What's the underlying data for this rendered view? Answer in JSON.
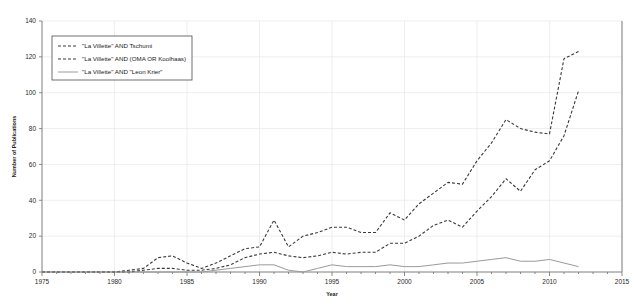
{
  "chart_data": {
    "type": "line",
    "title": "",
    "xlabel": "Year",
    "ylabel": "Number of Publications",
    "xlim": [
      1975,
      2015
    ],
    "ylim": [
      0,
      140
    ],
    "xticks": [
      1975,
      1980,
      1985,
      1990,
      1995,
      2000,
      2005,
      2010,
      2015
    ],
    "yticks": [
      0,
      20,
      40,
      60,
      80,
      100,
      120,
      140
    ],
    "grid": true,
    "legend_position": "upper-left",
    "x": [
      1975,
      1976,
      1977,
      1978,
      1979,
      1980,
      1981,
      1982,
      1983,
      1984,
      1985,
      1986,
      1987,
      1988,
      1989,
      1990,
      1991,
      1992,
      1993,
      1994,
      1995,
      1996,
      1997,
      1998,
      1999,
      2000,
      2001,
      2002,
      2003,
      2004,
      2005,
      2006,
      2007,
      2008,
      2009,
      2010,
      2011,
      2012
    ],
    "series": [
      {
        "name": "\"La Villette\" AND Tschumi",
        "style": "dashed",
        "color": "#3a3a3a",
        "values": [
          0,
          0,
          0,
          0,
          0,
          0,
          1,
          2,
          8,
          9,
          5,
          2,
          5,
          9,
          13,
          14,
          29,
          14,
          20,
          22,
          25,
          25,
          22,
          22,
          33,
          29,
          38,
          44,
          50,
          49,
          62,
          72,
          85,
          80,
          78,
          77,
          119,
          123
        ]
      },
      {
        "name": "\"La Villette\" AND (OMA OR Koolhaas)",
        "style": "dashed",
        "color": "#3a3a3a",
        "values": [
          0,
          0,
          0,
          0,
          0,
          0,
          0,
          1,
          2,
          2,
          1,
          1,
          2,
          4,
          8,
          10,
          11,
          9,
          8,
          9,
          11,
          10,
          11,
          11,
          16,
          16,
          20,
          26,
          29,
          25,
          34,
          42,
          52,
          45,
          57,
          62,
          76,
          101
        ]
      },
      {
        "name": "\"La Villette\" AND \"Leon Krier\"",
        "style": "solid",
        "color": "#9a9a9a",
        "values": [
          0,
          0,
          0,
          0,
          0,
          0,
          0,
          0,
          0,
          0,
          0,
          0,
          1,
          2,
          3,
          4,
          4,
          1,
          0,
          2,
          4,
          3,
          3,
          3,
          4,
          3,
          3,
          4,
          5,
          5,
          6,
          7,
          8,
          6,
          6,
          7,
          5,
          3
        ]
      }
    ]
  },
  "legend": {
    "entries": [
      "\"La Villette\" AND Tschumi",
      "\"La Villette\" AND (OMA OR Koolhaas)",
      "\"La Villette\" AND \"Leon Krier\""
    ]
  }
}
